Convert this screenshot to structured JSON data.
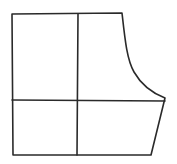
{
  "diagram": {
    "type": "pattern-block",
    "stroke_color": "#2a2a2a",
    "background": "#ffffff",
    "shapes": {
      "outline": "M12 14 L122 13 C125 40 127 60 134 72 C142 86 152 93 165 98 L151 155 L13 155 Z",
      "vertical_divider": "M78 14 L77 155",
      "horizontal_divider": "M12 100 L165 101"
    }
  }
}
